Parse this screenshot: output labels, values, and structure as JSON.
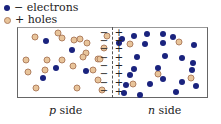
{
  "legend": {
    "electrons_label": "− electrons",
    "holes_label": "+ holes"
  },
  "labels": {
    "p_side_var": "p",
    "p_side_text": " side",
    "n_side_var": "n",
    "n_side_text": " side"
  },
  "colors": {
    "electron": "#1a237e",
    "hole": "#e8c49a",
    "hole_border": "#b08060"
  },
  "holes_p": [
    [
      35,
      37
    ],
    [
      58,
      33
    ],
    [
      62,
      38
    ],
    [
      74,
      40
    ],
    [
      80,
      39
    ],
    [
      87,
      43
    ],
    [
      86,
      53
    ],
    [
      26,
      60
    ],
    [
      47,
      60
    ],
    [
      62,
      60
    ],
    [
      83,
      57
    ],
    [
      98,
      59
    ],
    [
      28,
      72
    ],
    [
      45,
      70
    ],
    [
      73,
      66
    ],
    [
      93,
      70
    ],
    [
      98,
      80
    ],
    [
      36,
      88
    ],
    [
      77,
      88
    ],
    [
      102,
      90
    ],
    [
      107,
      36
    ],
    [
      104,
      48
    ],
    [
      100,
      59
    ]
  ],
  "electrons_p": [
    [
      46,
      41
    ],
    [
      72,
      50
    ],
    [
      56,
      68
    ],
    [
      86,
      71
    ],
    [
      43,
      78
    ]
  ],
  "electrons_n": [
    [
      122,
      39
    ],
    [
      134,
      36
    ],
    [
      147,
      34
    ],
    [
      163,
      34
    ],
    [
      173,
      37
    ],
    [
      119,
      43
    ],
    [
      145,
      44
    ],
    [
      163,
      43
    ],
    [
      194,
      45
    ],
    [
      137,
      57
    ],
    [
      165,
      56
    ],
    [
      182,
      58
    ],
    [
      193,
      63
    ],
    [
      134,
      69
    ],
    [
      158,
      68
    ],
    [
      130,
      75
    ],
    [
      192,
      70
    ],
    [
      126,
      85
    ],
    [
      150,
      84
    ],
    [
      163,
      79
    ],
    [
      182,
      82
    ],
    [
      176,
      92
    ],
    [
      140,
      95
    ],
    [
      196,
      86
    ],
    [
      124,
      93
    ]
  ],
  "holes_n": [
    [
      130,
      44
    ],
    [
      179,
      42
    ],
    [
      133,
      84
    ],
    [
      158,
      74
    ],
    [
      191,
      78
    ]
  ],
  "minus_signs": [
    [
      104,
      33
    ],
    [
      104,
      41
    ],
    [
      104,
      49
    ],
    [
      104,
      58
    ],
    [
      104,
      66
    ],
    [
      104,
      74
    ],
    [
      104,
      83
    ],
    [
      104,
      91
    ]
  ],
  "plus_signs": [
    [
      119,
      33
    ],
    [
      119,
      41
    ],
    [
      119,
      49
    ],
    [
      119,
      58
    ],
    [
      119,
      66
    ],
    [
      119,
      74
    ],
    [
      119,
      83
    ],
    [
      119,
      92
    ]
  ]
}
